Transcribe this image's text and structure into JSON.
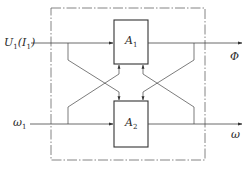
{
  "diagram": {
    "type": "block-diagram",
    "blocks": [
      {
        "id": "A1",
        "label": "A",
        "subscript": "1"
      },
      {
        "id": "A2",
        "label": "A",
        "subscript": "2"
      }
    ],
    "inputs": [
      {
        "id": "u1",
        "label": "U",
        "subscript": "1",
        "paren_label": "I",
        "paren_subscript": "1",
        "target": "A1"
      },
      {
        "id": "w1",
        "label": "ω",
        "subscript": "1",
        "target": "A2"
      }
    ],
    "outputs": [
      {
        "id": "phi",
        "label": "Φ",
        "source": "A1"
      },
      {
        "id": "w",
        "label": "ω",
        "source": "A2"
      }
    ],
    "cross_couplings": [
      {
        "from": "u1",
        "to": "A2"
      },
      {
        "from": "w1",
        "to": "A1"
      },
      {
        "from": "phi",
        "to": "A2"
      },
      {
        "from": "w",
        "to": "A1"
      }
    ],
    "boundary": "dash-dot system boundary",
    "colors": {
      "line": "#3a3a3a",
      "boundary": "#555555",
      "text": "#2a2a2a"
    }
  }
}
